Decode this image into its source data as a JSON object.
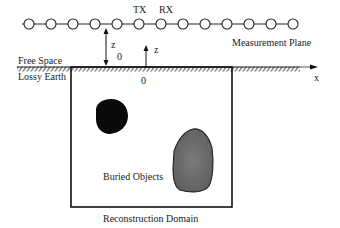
{
  "diagram": {
    "measurement_plane": {
      "label": "Measurement Plane",
      "sensor_count": 13,
      "tx_label": "TX",
      "rx_label": "RX"
    },
    "height_labels": {
      "z0_main": "z",
      "z0_sub": "0",
      "z": "z"
    },
    "regions": {
      "upper": "Free Space",
      "lower": "Lossy Earth"
    },
    "axis": {
      "x_label": "x",
      "origin_label": "0"
    },
    "domain": {
      "objects_label": "Buried Objects",
      "caption": "Reconstruction  Domain"
    },
    "colors": {
      "line": "#111111",
      "object_dark": "#0a0a0a",
      "object_gray": "#6e6e6e",
      "background": "#ffffff"
    }
  }
}
